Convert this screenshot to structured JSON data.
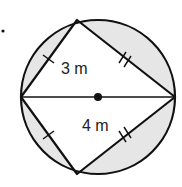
{
  "figure": {
    "marker": "•",
    "labels": {
      "side_short": "3 m",
      "side_long": "4 m"
    },
    "tick_marks": {
      "short_sides": 1,
      "long_sides": 2
    },
    "colors": {
      "stroke": "#111111",
      "shade": "#e6e6e6",
      "background": "#ffffff"
    }
  }
}
